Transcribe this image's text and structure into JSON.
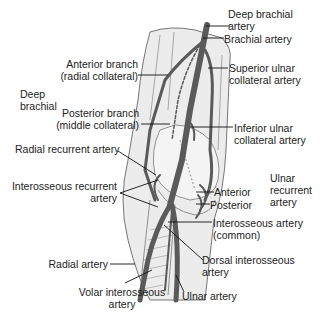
{
  "diagram": {
    "colors": {
      "artery": "#5a5a5a",
      "leader_line": "#111111",
      "arm_fill": "#ececec",
      "arm_outline": "#555555",
      "text": "#222222",
      "background": "#ffffff"
    },
    "labels": [
      {
        "id": "deep-brachial-artery",
        "lines": [
          "Deep brachial",
          "artery"
        ]
      },
      {
        "id": "brachial-artery",
        "lines": [
          "Brachial artery"
        ]
      },
      {
        "id": "anterior-branch",
        "lines": [
          "Anterior branch",
          "(radial collateral)"
        ]
      },
      {
        "id": "superior-ulnar-collateral",
        "lines": [
          "Superior ulnar",
          "collateral artery"
        ]
      },
      {
        "id": "deep-brachial",
        "lines": [
          "Deep",
          "brachial"
        ]
      },
      {
        "id": "posterior-branch",
        "lines": [
          "Posterior branch",
          "(middle collateral)"
        ]
      },
      {
        "id": "inferior-ulnar-collateral",
        "lines": [
          "Inferior ulnar",
          "collateral artery"
        ]
      },
      {
        "id": "radial-recurrent",
        "lines": [
          "Radial recurrent artery"
        ]
      },
      {
        "id": "interosseous-recurrent",
        "lines": [
          "Interosseous recurrent",
          "artery"
        ]
      },
      {
        "id": "anterior",
        "lines": [
          "Anterior"
        ]
      },
      {
        "id": "posterior",
        "lines": [
          "Posterior"
        ]
      },
      {
        "id": "ulnar-recurrent",
        "lines": [
          "Ulnar",
          "recurrent",
          "artery"
        ]
      },
      {
        "id": "interosseous-common",
        "lines": [
          "Interosseous artery",
          "(common)"
        ]
      },
      {
        "id": "radial-artery",
        "lines": [
          "Radial artery"
        ]
      },
      {
        "id": "dorsal-interosseous",
        "lines": [
          "Dorsal interosseous",
          "artery"
        ]
      },
      {
        "id": "volar-interosseous",
        "lines": [
          "Volar interosseous",
          "artery"
        ]
      },
      {
        "id": "ulnar-artery",
        "lines": [
          "Ulnar artery"
        ]
      }
    ]
  }
}
